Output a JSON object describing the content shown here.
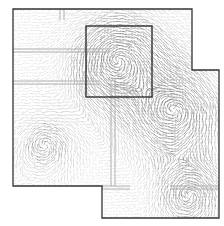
{
  "figure": {
    "colors": {
      "background": "#ffffff",
      "outline": "#333333",
      "wall_lines": "#b0b0b0",
      "vectors": "#8a8a8a",
      "vectors_dense": "#555555",
      "highlight_box": "#222222"
    },
    "outline_points": [
      [
        13,
        9
      ],
      [
        192,
        9
      ],
      [
        192,
        70
      ],
      [
        219,
        70
      ],
      [
        219,
        218
      ],
      [
        102,
        218
      ],
      [
        102,
        186
      ],
      [
        13,
        186
      ]
    ],
    "highlight_box": {
      "x": 86,
      "y": 26,
      "width": 66,
      "height": 71
    },
    "wall_lines": [
      {
        "x1": 13,
        "y1": 49,
        "x2": 110,
        "y2": 49
      },
      {
        "x1": 13,
        "y1": 52,
        "x2": 110,
        "y2": 52
      },
      {
        "x1": 13,
        "y1": 81,
        "x2": 100,
        "y2": 81
      },
      {
        "x1": 13,
        "y1": 84,
        "x2": 100,
        "y2": 84
      },
      {
        "x1": 111,
        "y1": 80,
        "x2": 111,
        "y2": 186
      },
      {
        "x1": 115,
        "y1": 80,
        "x2": 115,
        "y2": 186
      },
      {
        "x1": 102,
        "y1": 186,
        "x2": 130,
        "y2": 186
      },
      {
        "x1": 102,
        "y1": 189,
        "x2": 130,
        "y2": 189
      },
      {
        "x1": 170,
        "y1": 186,
        "x2": 219,
        "y2": 186
      },
      {
        "x1": 170,
        "y1": 189,
        "x2": 219,
        "y2": 189
      },
      {
        "x1": 60,
        "y1": 9,
        "x2": 60,
        "y2": 20
      },
      {
        "x1": 64,
        "y1": 9,
        "x2": 64,
        "y2": 20
      }
    ],
    "vortices": [
      {
        "cx": 118,
        "cy": 60,
        "r": 38,
        "strength": 1.0
      },
      {
        "cx": 175,
        "cy": 110,
        "r": 40,
        "strength": 0.8
      },
      {
        "cx": 45,
        "cy": 145,
        "r": 25,
        "strength": 0.6
      },
      {
        "cx": 190,
        "cy": 195,
        "r": 28,
        "strength": 0.7
      }
    ]
  }
}
